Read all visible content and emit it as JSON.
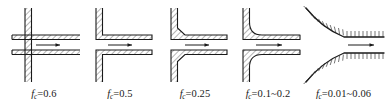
{
  "figure": {
    "name": "pipe-entrance-loss-coefficients",
    "stroke_color": "#1a1a1a",
    "hatch_color": "#2b2b2b",
    "background": "#ffffff"
  },
  "panels": [
    {
      "id": "panel-1",
      "geometry": "re-entrant-borda-inlet",
      "flow_arrow": "right-arrow",
      "label": {
        "symbol": "f",
        "subscript": "c",
        "equals": "=",
        "value": "0.6",
        "full": "fₑ=0.6"
      }
    },
    {
      "id": "panel-2",
      "geometry": "sharp-square-edged-inlet",
      "flow_arrow": "right-arrow",
      "label": {
        "symbol": "f",
        "subscript": "c",
        "equals": "=",
        "value": "0.5",
        "full": "fₑ=0.5"
      }
    },
    {
      "id": "panel-3",
      "geometry": "chamfered-beveled-inlet",
      "flow_arrow": "right-arrow",
      "label": {
        "symbol": "f",
        "subscript": "c",
        "equals": "=",
        "value": "0.25",
        "full": "fₑ=0.25"
      }
    },
    {
      "id": "panel-4",
      "geometry": "rounded-filleted-inlet",
      "flow_arrow": "right-arrow",
      "label": {
        "symbol": "f",
        "subscript": "c",
        "equals": "=",
        "value": "0.1~0.2",
        "full": "fₑ=0.1~0.2"
      }
    },
    {
      "id": "panel-5",
      "geometry": "bellmouth-smooth-inlet",
      "flow_arrow": "right-arrow",
      "label": {
        "symbol": "f",
        "subscript": "c",
        "equals": "=",
        "value": "0.01~0.06",
        "full": "fₑ=0.01~0.06"
      }
    }
  ]
}
